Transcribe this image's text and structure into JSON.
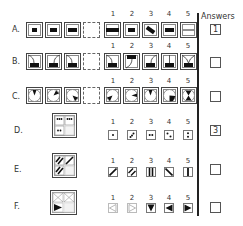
{
  "header": {
    "answers_label": "Answers"
  },
  "option_numbers": [
    "1",
    "2",
    "3",
    "4",
    "5"
  ],
  "rows": [
    {
      "label": "A.",
      "answer": "1",
      "sequence": [
        "small-bar",
        "medium-bar",
        "medium-bar",
        "blank"
      ],
      "options": [
        "long-thick-bar",
        "short-bar",
        "tilted-bar",
        "medium-bar",
        "thin-line"
      ]
    },
    {
      "label": "B.",
      "answer": "",
      "sequence": [
        "bar-with-left-curve",
        "bar-with-right-curve",
        "bar-with-left-curve",
        "blank"
      ],
      "options": [
        "bar-left-curve",
        "bar-top-curve",
        "bar-right-curve",
        "bar-vertical-stem",
        "bar-v-stem"
      ]
    },
    {
      "label": "C.",
      "answer": "",
      "sequence": [
        "circle-wedge-top",
        "circle-wedge-upper-right",
        "circle-wedge-lower-right",
        "blank"
      ],
      "options": [
        "circle-wedge-lower-left",
        "circle-wedge-right",
        "circle-wedge-top",
        "circle-large-wedge-lower-right",
        "circle-hourglass"
      ]
    },
    {
      "label": "D.",
      "answer": "3",
      "grid": [
        "four-dots",
        "four-dots",
        "two-dots",
        "blank"
      ],
      "options": [
        "one-dot",
        "three-dots-diagonal",
        "two-dots-horizontal",
        "two-dots-diagonal",
        "two-dots-vertical"
      ]
    },
    {
      "label": "E.",
      "answer": "",
      "grid": [
        "double-diagonal",
        "single-diagonal",
        "double-diagonal",
        "blank"
      ],
      "options": [
        "single-diagonal",
        "double-diagonal",
        "double-vertical",
        "backslash-diagonal",
        "single-vertical"
      ]
    },
    {
      "label": "F.",
      "answer": "",
      "grid": [
        "outline-triangles-x",
        "outline-triangles-x",
        "filled-right-triangle",
        "blank"
      ],
      "options": [
        "outline-left-triangle",
        "outline-right-triangle",
        "filled-down-triangle",
        "filled-left-triangle",
        "filled-right-triangle"
      ]
    }
  ]
}
